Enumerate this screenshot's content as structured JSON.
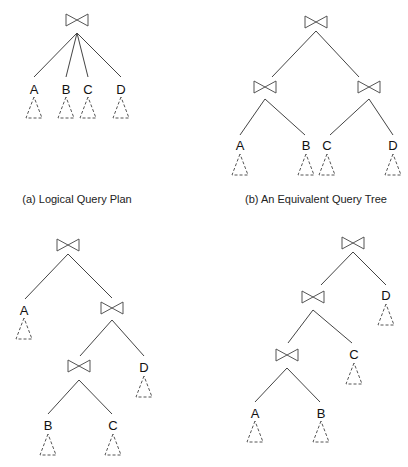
{
  "figure": {
    "join_symbol": "bowtie-join-icon",
    "panels": [
      {
        "id": "a",
        "caption": "(a) Logical Query Plan",
        "structure": "single 4-way join of A, B, C, D",
        "leaves": [
          "A",
          "B",
          "C",
          "D"
        ]
      },
      {
        "id": "b",
        "caption": "(b) An Equivalent Query Tree",
        "structure": "bushy tree: (A join B) join (C join D)",
        "leaves": [
          "A",
          "B",
          "C",
          "D"
        ]
      },
      {
        "id": "c",
        "caption": "",
        "structure": "right-deep: A join ((B join C) join D)",
        "leaves": [
          "A",
          "B",
          "C",
          "D"
        ]
      },
      {
        "id": "d",
        "caption": "",
        "structure": "left-deep: ((A join B) join C) join D",
        "leaves": [
          "A",
          "B",
          "C",
          "D"
        ]
      }
    ]
  },
  "labels": {
    "a": {
      "A": "A",
      "B": "B",
      "C": "C",
      "D": "D"
    },
    "b": {
      "A": "A",
      "B": "B",
      "C": "C",
      "D": "D"
    },
    "c": {
      "A": "A",
      "B": "B",
      "C": "C",
      "D": "D"
    },
    "d": {
      "A": "A",
      "B": "B",
      "C": "C",
      "D": "D"
    }
  }
}
